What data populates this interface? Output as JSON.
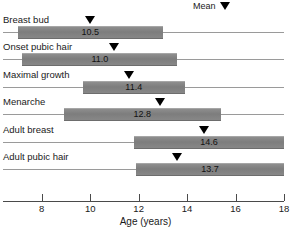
{
  "chart_data": {
    "type": "bar",
    "title": "",
    "xlabel": "Age (years)",
    "ylabel": "",
    "xlim": [
      6.4,
      18.0
    ],
    "xticks": [
      8,
      10,
      12,
      14,
      16,
      18
    ],
    "xtick_labels": [
      "8",
      "10",
      "12",
      "14",
      "16",
      "18"
    ],
    "grid": false,
    "legend": {
      "position": "top-right",
      "label": "Mean",
      "marker": "down-triangle"
    },
    "orientation": "horizontal",
    "categories": [
      "Breast bud",
      "Onset pubic hair",
      "Maximal growth",
      "Menarche",
      "Adult breast",
      "Adult pubic hair"
    ],
    "series": [
      {
        "name": "Age range",
        "ranges": [
          [
            7.0,
            13.0
          ],
          [
            7.2,
            13.6
          ],
          [
            9.7,
            13.9
          ],
          [
            8.9,
            15.4
          ],
          [
            11.8,
            18.0
          ],
          [
            11.9,
            18.0
          ]
        ]
      },
      {
        "name": "Mean",
        "values": [
          10.5,
          11.0,
          11.4,
          12.8,
          14.6,
          13.7
        ]
      }
    ],
    "value_labels": [
      "10.5",
      "11.0",
      "11.4",
      "12.8",
      "14.6",
      "13.7"
    ],
    "marker_positions": [
      10.0,
      11.0,
      11.6,
      12.9,
      14.7,
      13.6
    ],
    "colors": {
      "bar": "#7d7d7d",
      "marker": "#000000",
      "baseline": "#9a9a9a",
      "axis": "#4a4a4a",
      "text": "#1a1a1a",
      "background": "#ffffff"
    }
  }
}
